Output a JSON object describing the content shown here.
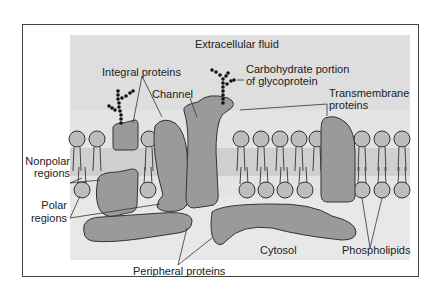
{
  "diagram": {
    "colors": {
      "background_fluid": "#dedede",
      "core_band": "#c9c9c9",
      "protein_fill": "#9a9a9a",
      "protein_stroke": "#333333",
      "phospholipid_head": "#bdbdbd",
      "carbohydrate": "#111111",
      "frame": "#444444"
    },
    "labels": {
      "extracellular": "Extracellular fluid",
      "integral": "Integral proteins",
      "channel": "Channel",
      "carbohydrate_line1": "Carbohydrate portion",
      "carbohydrate_line2": "of glycoprotein",
      "transmembrane_line1": "Transmembrane",
      "transmembrane_line2": "proteins",
      "nonpolar_line1": "Nonpolar",
      "nonpolar_line2": "regions",
      "polar_line1": "Polar",
      "polar_line2": "regions",
      "cytosol": "Cytosol",
      "peripheral": "Peripheral proteins",
      "phospholipids": "Phospholipids"
    }
  }
}
